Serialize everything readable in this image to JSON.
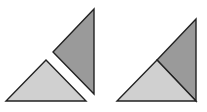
{
  "canvas": {
    "width": 207,
    "height": 112,
    "background": "#ffffff"
  },
  "colors": {
    "dark_fill": "#9a9a9a",
    "light_fill": "#d0d0d0",
    "stroke": "#222222"
  },
  "figures": [
    {
      "name": "separated-pieces",
      "shapes": [
        {
          "name": "dark-right-triangle",
          "fill": "dark_fill",
          "points": [
            [
              94,
              9
            ],
            [
              94,
              94
            ],
            [
              53,
              52
            ]
          ]
        },
        {
          "name": "light-isosceles-triangle",
          "fill": "light_fill",
          "points": [
            [
              6,
              101
            ],
            [
              86,
              101
            ],
            [
              46,
              60
            ]
          ]
        }
      ]
    },
    {
      "name": "assembled-triangle",
      "shapes": [
        {
          "name": "dark-right-triangle",
          "fill": "dark_fill",
          "points": [
            [
              196,
              19
            ],
            [
              196,
              101
            ],
            [
              157,
              60
            ]
          ]
        },
        {
          "name": "light-isosceles-triangle",
          "fill": "light_fill",
          "points": [
            [
              117,
              101
            ],
            [
              196,
              101
            ],
            [
              157,
              60
            ]
          ]
        }
      ]
    }
  ]
}
